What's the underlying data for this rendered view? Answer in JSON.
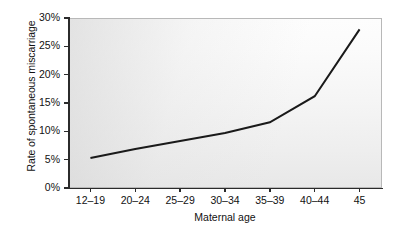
{
  "chart_data": {
    "type": "line",
    "title": "",
    "xlabel": "Maternal age",
    "ylabel": "Rate of spontaneous miscarriage",
    "categories": [
      "12–19",
      "20–24",
      "25–29",
      "30–34",
      "35–39",
      "40–44",
      "45"
    ],
    "values": [
      5.3,
      6.9,
      8.3,
      9.7,
      11.6,
      16.2,
      28.0
    ],
    "series": [
      {
        "name": "Rate of spontaneous miscarriage",
        "values": [
          5.3,
          6.9,
          8.3,
          9.7,
          11.6,
          16.2,
          28.0
        ]
      }
    ],
    "ylim": [
      0,
      30
    ],
    "yticks": [
      0,
      5,
      10,
      15,
      20,
      25,
      30
    ],
    "ytick_labels": [
      "0%",
      "5%",
      "10%",
      "15%",
      "20%",
      "25%",
      "30%"
    ],
    "y_unit": "%",
    "grid": false,
    "legend": false,
    "legend_position": "none",
    "markers": false,
    "line_color": "#1a1a1a",
    "plot_background": "#f2f2f2",
    "axis_color": "#2b2b2b"
  },
  "axes": {
    "y_title": "Rate of spontaneous miscarriage",
    "x_title": "Maternal age"
  }
}
